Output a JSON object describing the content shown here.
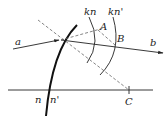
{
  "diagram": {
    "type": "optics-refraction-construction",
    "labels": {
      "ray_in": "a",
      "ray_out": "b",
      "point_A": "A",
      "point_B": "B",
      "point_C": "C",
      "arc_inner": "kn",
      "arc_outer": "kn'",
      "index_left": "n",
      "index_right": "n'"
    },
    "colors": {
      "line": "#222222",
      "dashed": "#555555",
      "background": "#ffffff"
    }
  }
}
